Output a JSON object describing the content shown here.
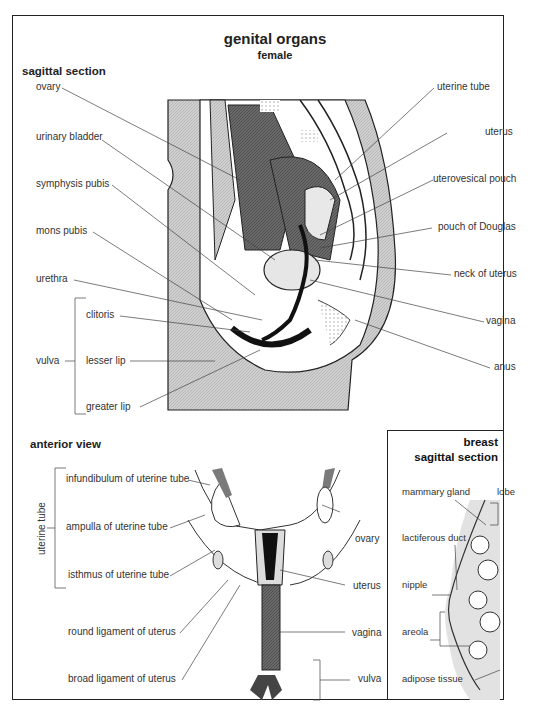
{
  "header": {
    "title": "genital organs",
    "subtitle": "female"
  },
  "sagittal": {
    "heading": "sagittal section",
    "left_labels": [
      "ovary",
      "urinary bladder",
      "symphysis pubis",
      "mons pubis",
      "urethra"
    ],
    "vulva_group": {
      "label": "vulva",
      "items": [
        "clitoris",
        "lesser lip",
        "greater lip"
      ]
    },
    "right_labels": [
      "uterine tube",
      "uterus",
      "uterovesical pouch",
      "pouch of Douglas",
      "neck of uterus",
      "vagina",
      "anus"
    ]
  },
  "anterior": {
    "heading": "anterior view",
    "tube_group": {
      "label": "uterine tube",
      "items": [
        "infundibulum of uterine tube",
        "ampulla of uterine tube",
        "isthmus of uterine tube"
      ]
    },
    "left_labels": [
      "round ligament of uterus",
      "broad ligament of uterus"
    ],
    "right_labels": [
      "ovary",
      "uterus",
      "vagina",
      "vulva"
    ]
  },
  "breast": {
    "heading_1": "breast",
    "heading_2": "sagittal section",
    "labels": [
      "mammary gland",
      "lobe",
      "lactiferous duct",
      "nipple",
      "areola",
      "adipose tissue"
    ]
  }
}
